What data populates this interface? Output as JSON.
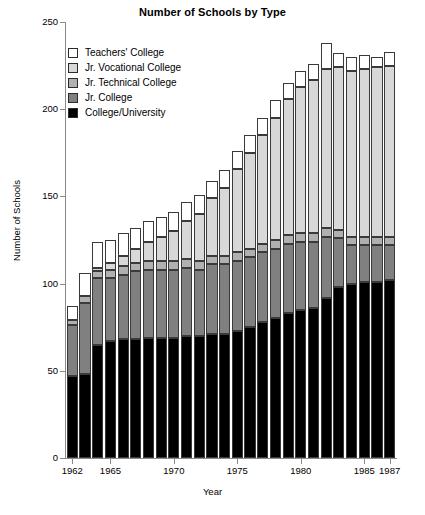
{
  "chart_data": {
    "type": "bar",
    "subtype": "stacked-bar",
    "title": "Number of Schools by Type",
    "xlabel": "Year",
    "ylabel": "Number of Schools",
    "ylim": [
      0,
      250
    ],
    "yticks": [
      0,
      50,
      100,
      150,
      200,
      250
    ],
    "xtick_labels": [
      "1962",
      "1965",
      "1970",
      "1975",
      "1980",
      "1985",
      "1987"
    ],
    "xtick_years": [
      1962,
      1965,
      1970,
      1975,
      1980,
      1985,
      1987
    ],
    "grid": false,
    "legend_position": "upper left",
    "categories": [
      1962,
      1963,
      1964,
      1965,
      1966,
      1967,
      1968,
      1969,
      1970,
      1971,
      1972,
      1973,
      1974,
      1975,
      1976,
      1977,
      1978,
      1979,
      1980,
      1981,
      1982,
      1983,
      1984,
      1985,
      1986,
      1987
    ],
    "stack_order_bottom_to_top": [
      "College/University",
      "Jr. College",
      "Jr. Technical College",
      "Jr. Vocational College",
      "Teachers' College"
    ],
    "series": [
      {
        "name": "College/University",
        "color": "#000000",
        "values": [
          47,
          48,
          65,
          67,
          68,
          68,
          69,
          69,
          69,
          70,
          70,
          71,
          71,
          73,
          75,
          78,
          80,
          83,
          85,
          86,
          92,
          98,
          100,
          101,
          101,
          102
        ]
      },
      {
        "name": "Jr. College",
        "color": "#808080",
        "values": [
          29,
          41,
          38,
          36,
          37,
          39,
          39,
          39,
          39,
          39,
          38,
          40,
          40,
          40,
          40,
          40,
          40,
          40,
          39,
          38,
          35,
          28,
          22,
          21,
          21,
          20
        ]
      },
      {
        "name": "Jr. Technical College",
        "color": "#b0b0b0",
        "values": [
          3,
          4,
          4,
          5,
          5,
          5,
          5,
          5,
          5,
          5,
          5,
          5,
          5,
          5,
          5,
          5,
          5,
          5,
          5,
          5,
          5,
          5,
          5,
          5,
          5,
          5
        ]
      },
      {
        "name": "Jr. Vocational College",
        "color": "#d8d8d8",
        "values": [
          0,
          0,
          2,
          4,
          6,
          8,
          11,
          14,
          17,
          22,
          27,
          33,
          39,
          48,
          55,
          62,
          70,
          78,
          84,
          88,
          91,
          93,
          95,
          96,
          97,
          98
        ]
      },
      {
        "name": "Teachers' College",
        "color": "#ffffff",
        "values": [
          8,
          13,
          15,
          13,
          13,
          12,
          12,
          11,
          11,
          11,
          11,
          10,
          10,
          10,
          10,
          10,
          10,
          9,
          9,
          9,
          15,
          8,
          8,
          8,
          6,
          8
        ]
      }
    ],
    "totals": [
      87,
      106,
      124,
      125,
      129,
      132,
      136,
      138,
      141,
      147,
      151,
      159,
      165,
      176,
      185,
      195,
      205,
      215,
      222,
      226,
      238,
      232,
      230,
      231,
      230,
      233
    ]
  },
  "legend": {
    "items": [
      {
        "label": "Teachers' College",
        "color": "#ffffff"
      },
      {
        "label": "Jr. Vocational College",
        "color": "#d8d8d8"
      },
      {
        "label": "Jr. Technical College",
        "color": "#b0b0b0"
      },
      {
        "label": "Jr. College",
        "color": "#808080"
      },
      {
        "label": "College/University",
        "color": "#000000"
      }
    ]
  }
}
